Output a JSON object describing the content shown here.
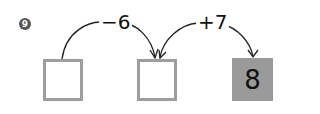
{
  "problem": {
    "number": "9",
    "steps": [
      {
        "operation": "−6"
      },
      {
        "operation": "+7"
      }
    ],
    "boxes": [
      {
        "value": ""
      },
      {
        "value": ""
      },
      {
        "value": "8"
      }
    ]
  },
  "colors": {
    "box_border": "#9e9e9e",
    "filled_box": "#9a9a9a",
    "arrow": "#222222",
    "badge": "#555555"
  }
}
